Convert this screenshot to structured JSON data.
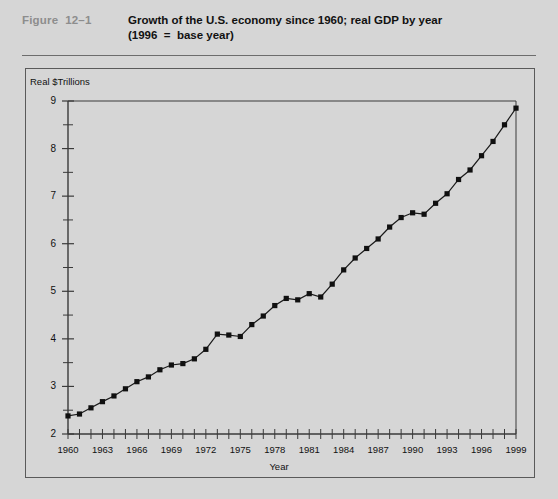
{
  "header": {
    "figure_number": "Figure  12–1",
    "title_line1": "Growth of the U.S. economy since 1960; real GDP by year",
    "title_line2": "(1996  =  base year)"
  },
  "chart_data": {
    "type": "line",
    "title": "Growth of the U.S. economy since 1960; real GDP by year (1996 = base year)",
    "xlabel": "Year",
    "ylabel": "Real $Trillions",
    "ylim": [
      2,
      9
    ],
    "xlim": [
      1960,
      1999
    ],
    "grid": false,
    "legend": null,
    "y_ticks": [
      2,
      3,
      4,
      5,
      6,
      7,
      8,
      9
    ],
    "y_minor_ticks": [
      2.5,
      3.5,
      4.5,
      5.5,
      6.5,
      7.5,
      8.5
    ],
    "x_ticks_labeled": [
      1960,
      1963,
      1966,
      1969,
      1972,
      1975,
      1978,
      1981,
      1984,
      1987,
      1990,
      1993,
      1996,
      1999
    ],
    "x_tick_step": 1,
    "marker": "square",
    "x": [
      1960,
      1961,
      1962,
      1963,
      1964,
      1965,
      1966,
      1967,
      1968,
      1969,
      1970,
      1971,
      1972,
      1973,
      1974,
      1975,
      1976,
      1977,
      1978,
      1979,
      1980,
      1981,
      1982,
      1983,
      1984,
      1985,
      1986,
      1987,
      1988,
      1989,
      1990,
      1991,
      1992,
      1993,
      1994,
      1995,
      1996,
      1997,
      1998,
      1999
    ],
    "values": [
      2.38,
      2.42,
      2.55,
      2.68,
      2.8,
      2.95,
      3.1,
      3.2,
      3.35,
      3.45,
      3.48,
      3.58,
      3.78,
      4.1,
      4.08,
      4.05,
      4.3,
      4.48,
      4.7,
      4.85,
      4.82,
      4.95,
      4.88,
      5.15,
      5.45,
      5.7,
      5.9,
      6.1,
      6.35,
      6.55,
      6.65,
      6.62,
      6.85,
      7.05,
      7.35,
      7.55,
      7.85,
      8.15,
      8.5,
      8.85
    ],
    "units": "Trillions of 1996 dollars"
  }
}
